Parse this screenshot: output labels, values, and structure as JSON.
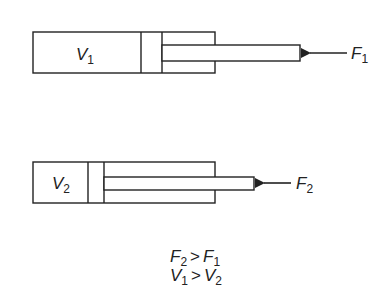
{
  "diagram": {
    "type": "hydraulic-cylinder-comparison",
    "stroke_color": "#222222",
    "background": "#ffffff",
    "cylinders": [
      {
        "id": "cylinder-1",
        "volume_label": "V",
        "volume_subscript": "1",
        "force_label": "F",
        "force_subscript": "1"
      },
      {
        "id": "cylinder-2",
        "volume_label": "V",
        "volume_subscript": "2",
        "force_label": "F",
        "force_subscript": "2"
      }
    ],
    "relations": [
      {
        "left": "F",
        "left_sub": "2",
        "op": ">",
        "right": "F",
        "right_sub": "1"
      },
      {
        "left": "V",
        "left_sub": "1",
        "op": ">",
        "right": "V",
        "right_sub": "2"
      }
    ]
  }
}
